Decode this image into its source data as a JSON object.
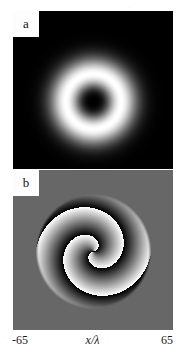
{
  "figure": {
    "background_color": "#ffffff",
    "width": 185,
    "height": 361
  },
  "panels": [
    {
      "id": "a",
      "label": "a",
      "kind": "intensity",
      "background_color": "#000000",
      "description": "donut-shaped annular intensity profile of an optical vortex beam"
    },
    {
      "id": "b",
      "label": "b",
      "kind": "phase",
      "background_color": "#676767",
      "description": "two-armed spiral phase map of an optical vortex beam"
    }
  ],
  "axis": {
    "min_label": "-65",
    "name_label": "x/λ",
    "max_label": "65"
  },
  "chart_data": [
    {
      "type": "heatmap",
      "panel": "a",
      "title": "a",
      "xlabel": "x/λ",
      "ylabel": "",
      "xlim": [
        -65,
        65
      ],
      "ylim": [
        -65,
        65
      ],
      "grid": false,
      "legend": "none",
      "colormap": "gray",
      "quantity": "intensity",
      "value_range": [
        0,
        1
      ],
      "structure": "annulus",
      "center": [
        0,
        0
      ],
      "ring_peak_radius": 22.5,
      "ring_width": 13.0,
      "topological_charge": 2,
      "notes": "bright ring (doughnut) on black background; intensity zero at the on-axis phase singularity"
    },
    {
      "type": "heatmap",
      "panel": "b",
      "title": "b",
      "xlabel": "x/λ",
      "ylabel": "",
      "xlim": [
        -65,
        65
      ],
      "ylim": [
        -65,
        65
      ],
      "grid": false,
      "legend": "none",
      "colormap": "gray",
      "quantity": "phase",
      "value_range": [
        -3.14159,
        3.14159
      ],
      "structure": "spiral",
      "center": [
        0,
        0
      ],
      "arms": 2,
      "topological_charge": 2,
      "spiral_outer_radius": 47,
      "spiral_turns": 2,
      "notes": "two interleaved spiral arms wrapping twice; black-to-white ramps are 2-pi phase jumps"
    }
  ]
}
